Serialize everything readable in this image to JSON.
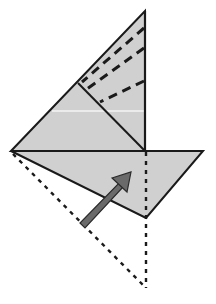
{
  "diagram": {
    "colors": {
      "background": "#ffffff",
      "paper_fill": "#d0d0d0",
      "outline": "#1a1a1a",
      "arrow_fill": "#6a6a6a",
      "arrow_stroke": "#2a2a2a",
      "highlight_line": "#f4f4f4"
    },
    "shapes": {
      "upper_triangle": "11,151 145,11 145,151",
      "lower_flap": "11,151 203,151 146,218",
      "hidden_triangle": "11,151 146,288 146,218"
    },
    "lines": {
      "inner_diagonal": {
        "x1": 78,
        "y1": 83,
        "x2": 145,
        "y2": 151
      },
      "center_vertical": {
        "x1": 145,
        "y1": 11,
        "x2": 145,
        "y2": 151
      },
      "baseline": {
        "x1": 11,
        "y1": 151,
        "x2": 203,
        "y2": 151
      },
      "highlight": {
        "x1": 52,
        "y1": 111,
        "x2": 145,
        "y2": 111
      }
    },
    "dashed_fold_lines": [
      {
        "x1": 144,
        "y1": 28,
        "x2": 82,
        "y2": 82
      },
      {
        "x1": 144,
        "y1": 48,
        "x2": 87,
        "y2": 89
      },
      {
        "x1": 144,
        "y1": 81,
        "x2": 100,
        "y2": 102
      }
    ],
    "dotted_lines": [
      {
        "x1": 13,
        "y1": 154,
        "x2": 146,
        "y2": 288
      },
      {
        "x1": 146,
        "y1": 152,
        "x2": 146,
        "y2": 288
      }
    ],
    "arrow": {
      "direction": "up-right",
      "shaft": "80,223 85,228 124,186 120,182",
      "head": "112,178 131,172 127,192"
    }
  }
}
